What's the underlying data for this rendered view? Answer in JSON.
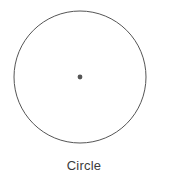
{
  "figure": {
    "caption": "Circle",
    "shape_name": "circle",
    "background_color": "#ffffff",
    "outline_color": "#555555",
    "outline_width_px": 1,
    "center_dot_color": "#555555",
    "center_dot_radius_px": 2.4,
    "caption_color": "#3b3b3b"
  },
  "chart_data": {
    "type": "diagram",
    "title": "Circle",
    "shapes": [
      {
        "name": "circle-outline",
        "kind": "circle",
        "center_x": 80,
        "center_y": 77,
        "radius": 66,
        "fill": "none",
        "stroke": "#555555",
        "stroke_width": 1
      },
      {
        "name": "center-point",
        "kind": "point",
        "center_x": 80,
        "center_y": 77,
        "radius": 2.4,
        "fill": "#555555",
        "stroke": "none"
      }
    ],
    "labels": [
      {
        "name": "caption",
        "text": "Circle",
        "x": 84,
        "y": 171,
        "anchor": "middle"
      }
    ],
    "canvas": {
      "width": 194,
      "height": 185
    }
  }
}
